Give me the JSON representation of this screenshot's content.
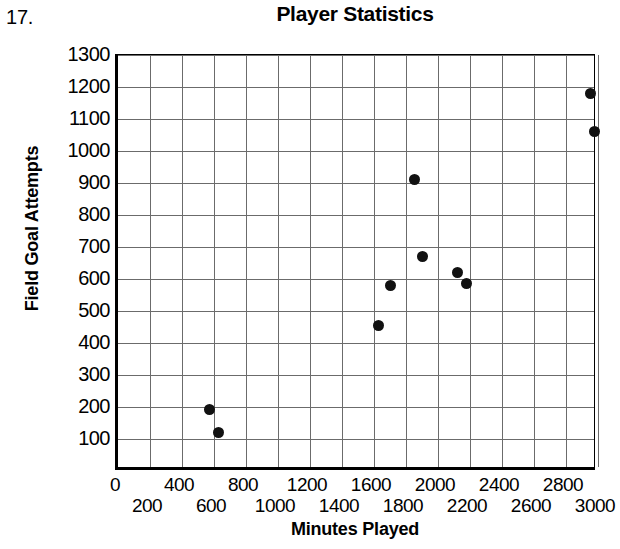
{
  "problem_number": "17.",
  "chart_data": {
    "type": "scatter",
    "title": "Player Statistics",
    "xlabel": "Minutes Played",
    "ylabel": "Field Goal Attempts",
    "xlim": [
      0,
      3000
    ],
    "ylim": [
      0,
      1300
    ],
    "xticks": [
      0,
      200,
      400,
      600,
      800,
      1000,
      1200,
      1400,
      1600,
      1800,
      2000,
      2200,
      2400,
      2600,
      2800,
      3000
    ],
    "xtick_labels": [
      "0",
      "200",
      "400",
      "600",
      "800",
      "1000",
      "1200",
      "1400",
      "1600",
      "1800",
      "2000",
      "2200",
      "2400",
      "2600",
      "2800",
      "3000"
    ],
    "xtick_stagger": true,
    "yticks": [
      100,
      200,
      300,
      400,
      500,
      600,
      700,
      800,
      900,
      1000,
      1100,
      1200,
      1300
    ],
    "ytick_labels": [
      "100",
      "200",
      "300",
      "400",
      "500",
      "600",
      "700",
      "800",
      "900",
      "1000",
      "1100",
      "1200",
      "1300"
    ],
    "grid": true,
    "grid_color": "#6b6b6b",
    "point_color": "#111111",
    "legend": null,
    "points": [
      {
        "x": 570,
        "y": 192
      },
      {
        "x": 630,
        "y": 120
      },
      {
        "x": 1630,
        "y": 455
      },
      {
        "x": 1700,
        "y": 580
      },
      {
        "x": 1850,
        "y": 910
      },
      {
        "x": 1900,
        "y": 670
      },
      {
        "x": 2120,
        "y": 620
      },
      {
        "x": 2180,
        "y": 585
      },
      {
        "x": 2950,
        "y": 1180
      },
      {
        "x": 2980,
        "y": 1060
      }
    ]
  }
}
